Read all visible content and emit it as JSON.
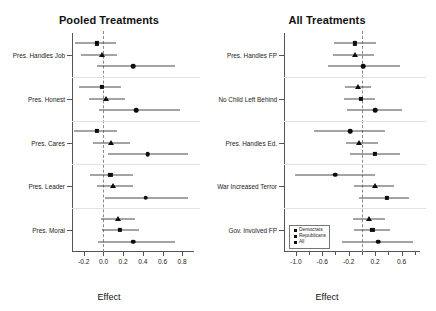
{
  "chart_data": [
    {
      "type": "scatter",
      "title": "Pooled Treatments",
      "xlabel": "Effect",
      "ylabel": "",
      "xlim": [
        -0.32,
        0.92
      ],
      "xticks": [
        -0.2,
        0.0,
        0.2,
        0.4,
        0.6,
        0.8
      ],
      "xticklabels": [
        "-0.2",
        "0.0",
        "0.2",
        "0.4",
        "0.6",
        "0.8"
      ],
      "grid": false,
      "reference_line": 0.0,
      "legend": "none",
      "categories": [
        "Pres. Handles Job",
        "Pres. Honest",
        "Pres. Cares",
        "Pres. Leader",
        "Pres. Moral"
      ],
      "series": [
        {
          "name": "Democrats",
          "marker": "square"
        },
        {
          "name": "Republicans",
          "marker": "triangle"
        },
        {
          "name": "All",
          "marker": "circle"
        }
      ],
      "points": [
        {
          "category": "Pres. Handles Job",
          "series": "Democrats",
          "marker": "square",
          "estimate": -0.07,
          "ci_low": -0.29,
          "ci_high": 0.13
        },
        {
          "category": "Pres. Handles Job",
          "series": "Republicans",
          "marker": "triangle",
          "estimate": -0.02,
          "ci_low": -0.23,
          "ci_high": 0.14
        },
        {
          "category": "Pres. Handles Job",
          "series": "All",
          "marker": "circle",
          "estimate": 0.3,
          "ci_low": -0.07,
          "ci_high": 0.73
        },
        {
          "category": "Pres. Honest",
          "series": "Democrats",
          "marker": "square",
          "estimate": -0.02,
          "ci_low": -0.25,
          "ci_high": 0.18
        },
        {
          "category": "Pres. Honest",
          "series": "Republicans",
          "marker": "triangle",
          "estimate": 0.03,
          "ci_low": -0.15,
          "ci_high": 0.22
        },
        {
          "category": "Pres. Honest",
          "series": "All",
          "marker": "circle",
          "estimate": 0.33,
          "ci_low": -0.05,
          "ci_high": 0.78
        },
        {
          "category": "Pres. Cares",
          "series": "Democrats",
          "marker": "square",
          "estimate": -0.07,
          "ci_low": -0.3,
          "ci_high": 0.14
        },
        {
          "category": "Pres. Cares",
          "series": "Republicans",
          "marker": "triangle",
          "estimate": 0.08,
          "ci_low": -0.11,
          "ci_high": 0.27
        },
        {
          "category": "Pres. Cares",
          "series": "All",
          "marker": "circle",
          "estimate": 0.45,
          "ci_low": 0.05,
          "ci_high": 0.86
        },
        {
          "category": "Pres. Leader",
          "series": "Democrats",
          "marker": "square",
          "estimate": 0.07,
          "ci_low": -0.14,
          "ci_high": 0.3
        },
        {
          "category": "Pres. Leader",
          "series": "Republicans",
          "marker": "triangle",
          "estimate": 0.1,
          "ci_low": -0.07,
          "ci_high": 0.3
        },
        {
          "category": "Pres. Leader",
          "series": "All",
          "marker": "circle",
          "estimate": 0.43,
          "ci_low": 0.02,
          "ci_high": 0.86
        },
        {
          "category": "Pres. Moral",
          "series": "Republicans",
          "marker": "triangle",
          "estimate": 0.15,
          "ci_low": -0.03,
          "ci_high": 0.32
        },
        {
          "category": "Pres. Moral",
          "series": "Democrats",
          "marker": "square",
          "estimate": 0.17,
          "ci_low": -0.02,
          "ci_high": 0.36
        },
        {
          "category": "Pres. Moral",
          "series": "All",
          "marker": "circle",
          "estimate": 0.3,
          "ci_low": -0.06,
          "ci_high": 0.73
        }
      ]
    },
    {
      "type": "scatter",
      "title": "All Treatments",
      "xlabel": "Effect",
      "ylabel": "",
      "xlim": [
        -1.18,
        0.88
      ],
      "xticks": [
        -1.0,
        -0.8,
        -0.6,
        -0.4,
        -0.2,
        0.0,
        0.2,
        0.4,
        0.6,
        0.8
      ],
      "xticklabels": [
        "-1.0",
        "",
        "-0.6",
        "",
        "-0.2",
        "",
        "0.2",
        "",
        "0.6",
        ""
      ],
      "grid": false,
      "reference_line": 0.0,
      "legend": "bottom-left",
      "legend_entries": [
        "Democrats",
        "Republicans",
        "All"
      ],
      "categories": [
        "Pres. Handles FP",
        "No Child Left Behind",
        "Pres. Handles Ed.",
        "War Increased Terror",
        "Gov. Involved FP"
      ],
      "series": [
        {
          "name": "Democrats",
          "marker": "square"
        },
        {
          "name": "Republicans",
          "marker": "triangle"
        },
        {
          "name": "All",
          "marker": "circle"
        }
      ],
      "points": [
        {
          "category": "Pres. Handles FP",
          "series": "Democrats",
          "marker": "square",
          "estimate": -0.1,
          "ci_low": -0.42,
          "ci_high": 0.22
        },
        {
          "category": "Pres. Handles FP",
          "series": "Republicans",
          "marker": "triangle",
          "estimate": -0.11,
          "ci_low": -0.44,
          "ci_high": 0.18
        },
        {
          "category": "Pres. Handles FP",
          "series": "All",
          "marker": "circle",
          "estimate": 0.02,
          "ci_low": -0.52,
          "ci_high": 0.58
        },
        {
          "category": "No Child Left Behind",
          "series": "Republicans",
          "marker": "triangle",
          "estimate": -0.06,
          "ci_low": -0.26,
          "ci_high": 0.14
        },
        {
          "category": "No Child Left Behind",
          "series": "Democrats",
          "marker": "square",
          "estimate": -0.02,
          "ci_low": -0.27,
          "ci_high": 0.2
        },
        {
          "category": "No Child Left Behind",
          "series": "All",
          "marker": "circle",
          "estimate": 0.2,
          "ci_low": -0.22,
          "ci_high": 0.6
        },
        {
          "category": "Pres. Handles Ed.",
          "series": "Democrats",
          "marker": "circle",
          "estimate": -0.18,
          "ci_low": -0.72,
          "ci_high": 0.35
        },
        {
          "category": "Pres. Handles Ed.",
          "series": "Republicans",
          "marker": "triangle",
          "estimate": -0.04,
          "ci_low": -0.24,
          "ci_high": 0.25
        },
        {
          "category": "Pres. Handles Ed.",
          "series": "All",
          "marker": "square",
          "estimate": 0.2,
          "ci_low": -0.18,
          "ci_high": 0.58
        },
        {
          "category": "War Increased Terror",
          "series": "Democrats",
          "marker": "circle",
          "estimate": -0.4,
          "ci_low": -1.02,
          "ci_high": 0.2
        },
        {
          "category": "War Increased Terror",
          "series": "Republicans",
          "marker": "triangle",
          "estimate": 0.2,
          "ci_low": -0.12,
          "ci_high": 0.48
        },
        {
          "category": "War Increased Terror",
          "series": "All",
          "marker": "square",
          "estimate": 0.38,
          "ci_low": -0.04,
          "ci_high": 0.72
        },
        {
          "category": "Gov. Involved FP",
          "series": "Republicans",
          "marker": "triangle",
          "estimate": 0.1,
          "ci_low": -0.14,
          "ci_high": 0.35
        },
        {
          "category": "Gov. Involved FP",
          "series": "Democrats",
          "marker": "square",
          "estimate": 0.16,
          "ci_low": -0.12,
          "ci_high": 0.42
        },
        {
          "category": "Gov. Involved FP",
          "series": "All",
          "marker": "circle",
          "estimate": 0.25,
          "ci_low": -0.3,
          "ci_high": 0.78
        }
      ]
    }
  ]
}
